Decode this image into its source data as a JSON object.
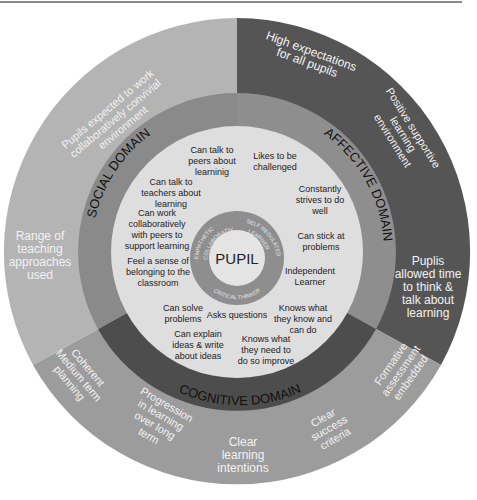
{
  "diagram": {
    "center_label": "PUPIL",
    "inner_ring": {
      "labels": [
        "EMPATHETIC COLLABORATIVE",
        "SELF REGULATED LEARNER",
        "CRITICAL THINKER"
      ]
    },
    "domains": [
      {
        "name": "SOCIAL DOMAIN",
        "color": "#8c8c8c"
      },
      {
        "name": "AFFECTIVE DOMAIN",
        "color": "#8c8c8c"
      },
      {
        "name": "COGNITIVE DOMAIN",
        "color": "#4d4d4d"
      }
    ],
    "pupil_attributes": {
      "social": [
        "Can talk to peers about learninig",
        "Can talk to teachers about learning",
        "Can work collaboratively with peers to support learning",
        "Feel a sense of belonging to the classroom"
      ],
      "affective": [
        "Likes to be challenged",
        "Constantly strives to do well",
        "Can stick at problems",
        "Independent Learner"
      ],
      "cognitive": [
        "Can solve problems",
        "Asks questions",
        "Can explain ideas & write about ideas",
        "Knows what they know and can do",
        "Knows what they need to do so improve"
      ]
    },
    "outer_ring": {
      "social": [
        "Pupils expected to work collaboratively convivial environment",
        "Range of teaching approaches used"
      ],
      "affective": [
        "High expectations for all pupils",
        "Positive supportive learning environment",
        "Puplis allowed time to think & talk about learning"
      ],
      "cognitive": [
        "Coherent Medium term planning",
        "Progression in learning over long term",
        "Clear learning intentions",
        "Clear success criteria",
        "Formative assessment embedded"
      ]
    },
    "colors": {
      "outer_social": "#b4b4b4",
      "outer_affective": "#555555",
      "outer_cognitive": "#9c9c9c",
      "inner_disc": "#dedede",
      "pupil_ring": "#8e8e8e",
      "pupil_center": "#e2e2e2"
    }
  },
  "text": {
    "center": "PUPIL",
    "ring_empathetic_1": "EMPATHETIC",
    "ring_empathetic_2": "COLLABORATIVE",
    "ring_self_1": "SELF REGULATED",
    "ring_self_2": "LEARNER",
    "ring_critical": "CRITICAL THINKER",
    "social_domain": "SOCIAL DOMAIN",
    "affective_domain": "AFFECTIVE DOMAIN",
    "cognitive_domain": "COGNITIVE DOMAIN",
    "s1": [
      "Can talk to",
      "peers about",
      "learninig"
    ],
    "s2": [
      "Can talk to",
      "teachers about",
      "learning"
    ],
    "s3": [
      "Can work",
      "collaboratively",
      "with peers to",
      "support learning"
    ],
    "s4": [
      "Feel a sense of",
      "belonging to the",
      "classroom"
    ],
    "a1": [
      "Likes to be",
      "challenged"
    ],
    "a2": [
      "Constantly",
      "strives to do",
      "well"
    ],
    "a3": [
      "Can stick at",
      "problems"
    ],
    "a4": [
      "Independent",
      "Learner"
    ],
    "c1": [
      "Can solve",
      "problems"
    ],
    "c2": [
      "Asks questions"
    ],
    "c3": [
      "Can explain",
      "ideas & write",
      "about ideas"
    ],
    "c4": [
      "Knows what",
      "they know and",
      "can do"
    ],
    "c5": [
      "Knows what",
      "they need to",
      "do so improve"
    ],
    "o_social_1": [
      "Pupils expected to work",
      "collaboratively convivial",
      "environment"
    ],
    "o_social_2": [
      "Range of",
      "teaching",
      "approaches",
      "used"
    ],
    "o_aff_1": [
      "High expectations",
      "for all pupils"
    ],
    "o_aff_2": [
      "Positive supportive",
      "learning",
      "environment"
    ],
    "o_aff_3": [
      "Puplis",
      "allowed time",
      "to think &",
      "talk about",
      "learning"
    ],
    "o_cog_1": [
      "Coherent",
      "Medium term",
      "planning"
    ],
    "o_cog_2": [
      "Progression",
      "in learning",
      "over long",
      "term"
    ],
    "o_cog_3": [
      "Clear",
      "learning",
      "intentions"
    ],
    "o_cog_4": [
      "Clear",
      "success",
      "criteria"
    ],
    "o_cog_5": [
      "Formative",
      "assessment",
      "embedded"
    ]
  }
}
